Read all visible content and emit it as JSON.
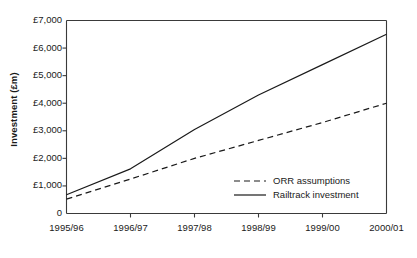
{
  "chart_data": {
    "type": "line",
    "title": "",
    "xlabel": "",
    "ylabel": "Investment (£m)",
    "categories": [
      "1995/96",
      "1996/97",
      "1997/98",
      "1998/99",
      "1999/00",
      "2000/01"
    ],
    "ylim": [
      0,
      7000
    ],
    "ytick_values": [
      0,
      1000,
      2000,
      3000,
      4000,
      5000,
      6000,
      7000
    ],
    "ytick_labels": [
      "0",
      "£1,000",
      "£2,000",
      "£3,000",
      "£4,000",
      "£5,000",
      "£6,000",
      "£7,000"
    ],
    "grid": false,
    "legend_position": "inside-lower-right",
    "series": [
      {
        "name": "ORR assumptions",
        "style": "dashed",
        "color": "#1a1a1a",
        "values": [
          520,
          1250,
          2000,
          2650,
          3300,
          4000
        ]
      },
      {
        "name": "Railtrack investment",
        "style": "solid",
        "color": "#1a1a1a",
        "values": [
          680,
          1620,
          3050,
          4300,
          5400,
          6500
        ]
      }
    ]
  },
  "axes": {
    "y_title": "Investment (£m)"
  },
  "legend": {
    "items": [
      {
        "label": "ORR assumptions",
        "style": "dashed"
      },
      {
        "label": "Railtrack investment",
        "style": "solid"
      }
    ]
  }
}
